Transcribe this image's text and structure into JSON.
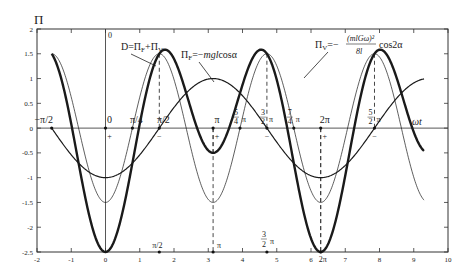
{
  "chart_data": {
    "type": "line",
    "title": "",
    "ylabel": "Π",
    "xlabel": "ωt",
    "xlim": [
      -2,
      10
    ],
    "ylim": [
      -2.5,
      2
    ],
    "xticks": [
      -2,
      -1,
      0,
      1,
      2,
      3,
      4,
      5,
      6,
      7,
      8,
      9,
      10
    ],
    "yticks": [
      2,
      1.5,
      1,
      0.5,
      0,
      -0.5,
      -1,
      -1.5,
      -2,
      -2.5
    ],
    "xtick_labels": [
      "-2",
      "-1",
      "0",
      "1",
      "2",
      "3",
      "4",
      "5",
      "6",
      "7",
      "8",
      "9",
      "10"
    ],
    "ytick_labels": [
      "2",
      "1.5",
      "1",
      "0.5",
      "0",
      "-0.5",
      "-1",
      "-1.5",
      "-2",
      "-2.5"
    ],
    "grid": false,
    "domain": [
      -1.5708,
      9.3
    ],
    "series": [
      {
        "name": "D = Π_F + Π_V",
        "formula": "-cos(a) - 1.5*cos(2a)",
        "style": "thick"
      },
      {
        "name": "Π_F = -mgl cosα",
        "formula": "-cos(a)",
        "style": "medium"
      },
      {
        "name": "Π_V = -(mlGω)²/(8l) cos2α",
        "formula": "-1.5*cos(2a)",
        "style": "thin"
      }
    ],
    "annotations": {
      "y_axis_zero": "0",
      "legend_D": "D=Π_F+Π_V",
      "legend_F": "Π_F=−mgl cosα",
      "legend_V_prefix": "Π_V=−",
      "legend_V_num": "(mlGω)²",
      "legend_V_den": "8l",
      "legend_V_suffix": "cos2α",
      "axis_marks": [
        {
          "label": "−π/2",
          "x": -1.5708,
          "sign": ""
        },
        {
          "label": "0",
          "x": 0,
          "sign": "+"
        },
        {
          "label": "π/4",
          "x": 0.7854,
          "sign": ""
        },
        {
          "label": "π/2",
          "x": 1.5708,
          "sign": "−"
        },
        {
          "label": "π",
          "x": 3.1416,
          "sign": "+"
        },
        {
          "label": "5/4 π",
          "x": 3.927,
          "sign": ""
        },
        {
          "label": "3/2 π",
          "x": 4.7124,
          "sign": "−"
        },
        {
          "label": "7/4 π",
          "x": 5.4978,
          "sign": ""
        },
        {
          "label": "2π",
          "x": 6.2832,
          "sign": "+"
        },
        {
          "label": "5/2 π",
          "x": 7.854,
          "sign": "−"
        }
      ],
      "bottom_marks": [
        {
          "label": "π/2",
          "x": 1.5708
        },
        {
          "label": "π",
          "x": 3.1416
        },
        {
          "label": "3/2 π",
          "x": 4.7124
        },
        {
          "label": "2π",
          "x": 6.2832
        }
      ],
      "dashed_verticals": [
        1.5708,
        3.1416,
        4.7124,
        6.2832,
        7.854
      ]
    }
  }
}
